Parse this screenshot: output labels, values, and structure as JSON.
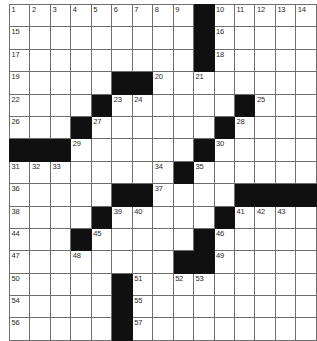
{
  "puzzle": {
    "title": "Crossword Grid",
    "rows": 15,
    "cols": 15,
    "cell_color": "#ffffff",
    "block_color": "#101010",
    "grid_line_color": "#6e6e6e",
    "number_color": "#2a2a2a",
    "grid": [
      [
        0,
        0,
        0,
        0,
        0,
        0,
        0,
        0,
        0,
        1,
        0,
        0,
        0,
        0,
        0
      ],
      [
        0,
        0,
        0,
        0,
        0,
        0,
        0,
        0,
        0,
        1,
        0,
        0,
        0,
        0,
        0
      ],
      [
        0,
        0,
        0,
        0,
        0,
        0,
        0,
        0,
        0,
        1,
        0,
        0,
        0,
        0,
        0
      ],
      [
        0,
        0,
        0,
        0,
        0,
        1,
        1,
        0,
        0,
        0,
        0,
        0,
        0,
        0,
        0
      ],
      [
        0,
        0,
        0,
        0,
        1,
        0,
        0,
        0,
        0,
        0,
        0,
        1,
        0,
        0,
        0
      ],
      [
        0,
        0,
        0,
        1,
        0,
        0,
        0,
        0,
        0,
        0,
        1,
        0,
        0,
        0,
        0
      ],
      [
        1,
        1,
        1,
        0,
        0,
        0,
        0,
        0,
        0,
        1,
        0,
        0,
        0,
        0,
        0
      ],
      [
        0,
        0,
        0,
        0,
        0,
        0,
        0,
        0,
        1,
        0,
        0,
        0,
        0,
        0,
        0
      ],
      [
        0,
        0,
        0,
        0,
        0,
        1,
        1,
        0,
        0,
        0,
        0,
        1,
        1,
        1,
        1
      ],
      [
        0,
        0,
        0,
        0,
        1,
        0,
        0,
        0,
        0,
        0,
        1,
        0,
        0,
        0,
        0
      ],
      [
        0,
        0,
        0,
        1,
        0,
        0,
        0,
        0,
        0,
        1,
        0,
        0,
        0,
        0,
        0
      ],
      [
        0,
        0,
        0,
        0,
        0,
        0,
        0,
        0,
        1,
        1,
        0,
        0,
        0,
        0,
        0
      ],
      [
        0,
        0,
        0,
        0,
        0,
        1,
        0,
        0,
        0,
        0,
        0,
        0,
        0,
        0,
        0
      ],
      [
        0,
        0,
        0,
        0,
        0,
        1,
        0,
        0,
        0,
        0,
        0,
        0,
        0,
        0,
        0
      ],
      [
        0,
        0,
        0,
        0,
        0,
        1,
        0,
        0,
        0,
        0,
        0,
        0,
        0,
        0,
        0
      ]
    ],
    "numbers": [
      [
        1,
        2,
        3,
        4,
        5,
        6,
        7,
        8,
        9,
        null,
        10,
        11,
        12,
        13,
        14
      ],
      [
        15,
        null,
        null,
        null,
        null,
        null,
        null,
        null,
        null,
        null,
        16,
        null,
        null,
        null,
        null
      ],
      [
        17,
        null,
        null,
        null,
        null,
        null,
        null,
        null,
        null,
        null,
        18,
        null,
        null,
        null,
        null
      ],
      [
        19,
        null,
        null,
        null,
        null,
        null,
        null,
        20,
        null,
        21,
        null,
        null,
        null,
        null,
        null
      ],
      [
        22,
        null,
        null,
        null,
        null,
        23,
        24,
        null,
        null,
        null,
        null,
        null,
        25,
        null,
        null
      ],
      [
        26,
        null,
        null,
        null,
        27,
        null,
        null,
        null,
        null,
        null,
        null,
        28,
        null,
        null,
        null
      ],
      [
        null,
        null,
        null,
        29,
        null,
        null,
        null,
        null,
        null,
        null,
        30,
        null,
        null,
        null,
        null
      ],
      [
        31,
        32,
        33,
        null,
        null,
        null,
        null,
        34,
        null,
        35,
        null,
        null,
        null,
        null,
        null
      ],
      [
        36,
        null,
        null,
        null,
        null,
        null,
        null,
        37,
        null,
        null,
        null,
        null,
        null,
        null,
        null
      ],
      [
        38,
        null,
        null,
        null,
        null,
        39,
        40,
        null,
        null,
        null,
        null,
        41,
        42,
        43,
        null
      ],
      [
        44,
        null,
        null,
        null,
        45,
        null,
        null,
        null,
        null,
        null,
        46,
        null,
        null,
        null,
        null
      ],
      [
        47,
        null,
        null,
        48,
        null,
        null,
        null,
        null,
        null,
        null,
        49,
        null,
        null,
        null,
        null
      ],
      [
        50,
        null,
        null,
        null,
        null,
        null,
        51,
        null,
        52,
        53,
        null,
        null,
        null,
        null,
        null
      ],
      [
        54,
        null,
        null,
        null,
        null,
        null,
        55,
        null,
        null,
        null,
        null,
        null,
        null,
        null,
        null
      ],
      [
        56,
        null,
        null,
        null,
        null,
        null,
        57,
        null,
        null,
        null,
        null,
        null,
        null,
        null,
        null
      ]
    ]
  }
}
